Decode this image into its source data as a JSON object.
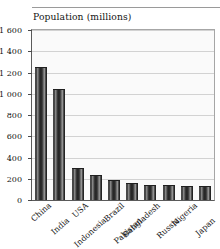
{
  "chart_data": {
    "type": "bar",
    "title": "Population (millions)",
    "xlabel": "",
    "ylabel": "",
    "ylim": [
      0,
      1600
    ],
    "grid": true,
    "legend": "none",
    "ytick_labels": [
      "1 600",
      "1 400",
      "1 200",
      "1 000",
      "800",
      "600",
      "400",
      "200",
      "0"
    ],
    "ytick_values": [
      1600,
      1400,
      1200,
      1000,
      800,
      600,
      400,
      200,
      0
    ],
    "categories": [
      "China",
      "India",
      "USA",
      "Indonesia",
      "Brazil",
      "Pakistan",
      "Bangladesh",
      "Russia",
      "Nigeria",
      "Japan"
    ],
    "values": [
      1250,
      1045,
      300,
      240,
      190,
      165,
      145,
      143,
      130,
      128
    ],
    "bar_color": "#2e2e2e",
    "plot_background": "#fafafa",
    "gridline_color": "#d2d2d2",
    "axis_color": "#5a5a5a"
  }
}
